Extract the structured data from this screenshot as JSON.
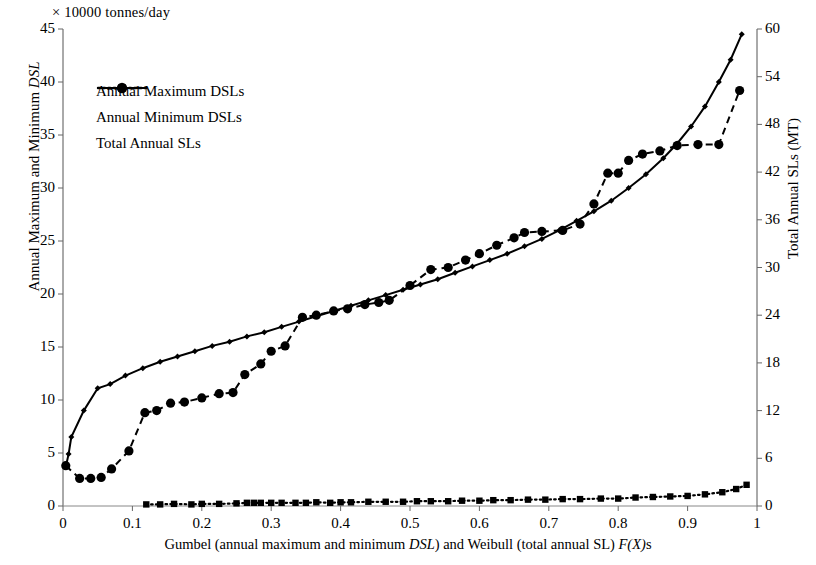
{
  "chart_data": {
    "type": "line",
    "title": "",
    "unit_note": "× 10000  tonnes/day",
    "xlabel": "Gumbel (annual maximum and minimum DSL) and Weibull (total annual SL) F(X)s",
    "ylabel_left": "Annual Maximum and Minimum DSL",
    "ylabel_right": "Total Annual SLs (MT)",
    "xlim": [
      0,
      1
    ],
    "ylim_left": [
      0,
      45
    ],
    "ylim_right": [
      0,
      60
    ],
    "xticks": [
      "0",
      "0.1",
      "0.2",
      "0.3",
      "0.4",
      "0.5",
      "0.6",
      "0.7",
      "0.8",
      "0.9",
      "1"
    ],
    "xtick_values": [
      0,
      0.1,
      0.2,
      0.3,
      0.4,
      0.5,
      0.6,
      0.7,
      0.8,
      0.9,
      1
    ],
    "yticks_left": [
      "0",
      "5",
      "10",
      "15",
      "20",
      "25",
      "30",
      "35",
      "40",
      "45"
    ],
    "ytick_left_values": [
      0,
      5,
      10,
      15,
      20,
      25,
      30,
      35,
      40,
      45
    ],
    "yticks_right": [
      "0",
      "6",
      "12",
      "18",
      "24",
      "30",
      "36",
      "42",
      "48",
      "54",
      "60"
    ],
    "ytick_right_values": [
      0,
      6,
      12,
      18,
      24,
      30,
      36,
      42,
      48,
      54,
      60
    ],
    "grid": false,
    "legend_position": "upper-left",
    "series": [
      {
        "name": "Annual Maximum DSLs",
        "axis": "left",
        "line_style": "solid",
        "marker": "diamond",
        "color": "#000000",
        "points": [
          [
            0.004,
            3.7
          ],
          [
            0.008,
            4.9
          ],
          [
            0.012,
            6.5
          ],
          [
            0.03,
            9.0
          ],
          [
            0.05,
            11.1
          ],
          [
            0.068,
            11.5
          ],
          [
            0.09,
            12.3
          ],
          [
            0.115,
            13.0
          ],
          [
            0.14,
            13.6
          ],
          [
            0.165,
            14.1
          ],
          [
            0.19,
            14.6
          ],
          [
            0.215,
            15.1
          ],
          [
            0.24,
            15.5
          ],
          [
            0.265,
            16.0
          ],
          [
            0.29,
            16.4
          ],
          [
            0.315,
            16.9
          ],
          [
            0.34,
            17.4
          ],
          [
            0.365,
            17.9
          ],
          [
            0.39,
            18.4
          ],
          [
            0.415,
            18.9
          ],
          [
            0.44,
            19.4
          ],
          [
            0.465,
            19.9
          ],
          [
            0.49,
            20.4
          ],
          [
            0.515,
            20.9
          ],
          [
            0.54,
            21.4
          ],
          [
            0.565,
            22.0
          ],
          [
            0.59,
            22.6
          ],
          [
            0.615,
            23.2
          ],
          [
            0.64,
            23.8
          ],
          [
            0.665,
            24.5
          ],
          [
            0.69,
            25.2
          ],
          [
            0.715,
            26.0
          ],
          [
            0.74,
            26.9
          ],
          [
            0.765,
            27.8
          ],
          [
            0.79,
            28.8
          ],
          [
            0.815,
            30.0
          ],
          [
            0.84,
            31.3
          ],
          [
            0.865,
            32.8
          ],
          [
            0.885,
            34.2
          ],
          [
            0.905,
            35.8
          ],
          [
            0.925,
            37.7
          ],
          [
            0.945,
            40.0
          ],
          [
            0.962,
            42.1
          ],
          [
            0.978,
            44.5
          ]
        ]
      },
      {
        "name": "Annual Minimum DSLs",
        "axis": "left",
        "line_style": "dotted",
        "marker": "square",
        "color": "#000000",
        "points": [
          [
            0.12,
            0.15
          ],
          [
            0.14,
            0.15
          ],
          [
            0.16,
            0.2
          ],
          [
            0.185,
            0.15
          ],
          [
            0.2,
            0.2
          ],
          [
            0.225,
            0.2
          ],
          [
            0.25,
            0.25
          ],
          [
            0.265,
            0.3
          ],
          [
            0.275,
            0.3
          ],
          [
            0.285,
            0.3
          ],
          [
            0.3,
            0.3
          ],
          [
            0.315,
            0.3
          ],
          [
            0.335,
            0.3
          ],
          [
            0.35,
            0.3
          ],
          [
            0.365,
            0.35
          ],
          [
            0.385,
            0.3
          ],
          [
            0.4,
            0.35
          ],
          [
            0.415,
            0.35
          ],
          [
            0.44,
            0.4
          ],
          [
            0.465,
            0.4
          ],
          [
            0.49,
            0.4
          ],
          [
            0.51,
            0.45
          ],
          [
            0.53,
            0.45
          ],
          [
            0.555,
            0.45
          ],
          [
            0.575,
            0.5
          ],
          [
            0.6,
            0.5
          ],
          [
            0.62,
            0.55
          ],
          [
            0.645,
            0.55
          ],
          [
            0.67,
            0.6
          ],
          [
            0.695,
            0.6
          ],
          [
            0.72,
            0.65
          ],
          [
            0.745,
            0.65
          ],
          [
            0.775,
            0.7
          ],
          [
            0.8,
            0.7
          ],
          [
            0.825,
            0.8
          ],
          [
            0.85,
            0.85
          ],
          [
            0.875,
            0.9
          ],
          [
            0.9,
            0.95
          ],
          [
            0.925,
            1.1
          ],
          [
            0.95,
            1.3
          ],
          [
            0.97,
            1.6
          ],
          [
            0.985,
            2.0
          ]
        ]
      },
      {
        "name": "Total Annual SLs",
        "axis": "right",
        "line_style": "dashed",
        "marker": "circle",
        "color": "#000000",
        "points_left_scale": [
          [
            0.004,
            3.8
          ],
          [
            0.024,
            2.6
          ],
          [
            0.04,
            2.6
          ],
          [
            0.055,
            2.7
          ],
          [
            0.07,
            3.5
          ],
          [
            0.095,
            5.2
          ],
          [
            0.118,
            8.8
          ],
          [
            0.135,
            9.0
          ],
          [
            0.155,
            9.7
          ],
          [
            0.175,
            9.8
          ],
          [
            0.2,
            10.2
          ],
          [
            0.225,
            10.6
          ],
          [
            0.245,
            10.7
          ],
          [
            0.262,
            12.4
          ],
          [
            0.285,
            13.4
          ],
          [
            0.3,
            14.6
          ],
          [
            0.32,
            15.1
          ],
          [
            0.345,
            17.8
          ],
          [
            0.365,
            18.0
          ],
          [
            0.39,
            18.4
          ],
          [
            0.41,
            18.6
          ],
          [
            0.435,
            19.0
          ],
          [
            0.455,
            19.2
          ],
          [
            0.47,
            19.4
          ],
          [
            0.5,
            20.8
          ],
          [
            0.53,
            22.3
          ],
          [
            0.555,
            22.5
          ],
          [
            0.58,
            23.2
          ],
          [
            0.6,
            23.8
          ],
          [
            0.625,
            24.6
          ],
          [
            0.65,
            25.3
          ],
          [
            0.665,
            25.8
          ],
          [
            0.69,
            25.9
          ],
          [
            0.72,
            26.0
          ],
          [
            0.745,
            26.6
          ],
          [
            0.765,
            28.5
          ],
          [
            0.785,
            31.4
          ],
          [
            0.8,
            31.4
          ],
          [
            0.815,
            32.6
          ],
          [
            0.835,
            33.2
          ],
          [
            0.86,
            33.5
          ],
          [
            0.885,
            34.0
          ],
          [
            0.915,
            34.1
          ],
          [
            0.945,
            34.1
          ],
          [
            0.975,
            39.2
          ]
        ]
      }
    ]
  },
  "legend": {
    "items": [
      {
        "label": "Annual Maximum DSLs",
        "marker": "diamond",
        "line_style": "solid"
      },
      {
        "label": "Annual Minimum DSLs",
        "marker": "square",
        "line_style": "dotted"
      },
      {
        "label": "Total Annual SLs",
        "marker": "circle",
        "line_style": "dashed"
      }
    ]
  }
}
